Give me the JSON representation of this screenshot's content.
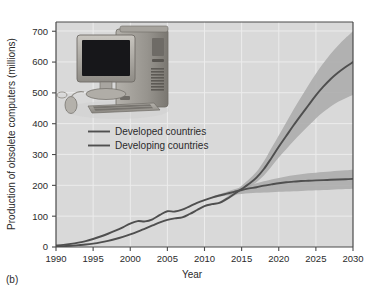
{
  "figure": {
    "panel_label": "(b)",
    "background": "#ffffff",
    "plot_background": "#d9d9d9",
    "grid_color": "#ececec",
    "axis_color": "#4a4a4a",
    "line_color": "#4f4f4f",
    "band_color": "#a9a9a9"
  },
  "inset_image": {
    "name": "desktop-computer-photo",
    "description": "Photograph of an obsolete desktop computer: CRT-style flat monitor, tower case, keyboard and mouse",
    "parts": [
      "monitor",
      "tower",
      "keyboard",
      "mouse"
    ]
  },
  "chart_data": {
    "type": "line",
    "title": "",
    "xlabel": "Year",
    "ylabel": "Production of obsolete computers (millions)",
    "xlim": [
      1990,
      2030
    ],
    "ylim": [
      0,
      730
    ],
    "xticks": [
      1990,
      1995,
      2000,
      2005,
      2010,
      2015,
      2020,
      2025,
      2030
    ],
    "yticks": [
      0,
      100,
      200,
      300,
      400,
      500,
      600,
      700
    ],
    "grid": true,
    "legend_position": "upper-left",
    "x": [
      1990,
      1991,
      1992,
      1993,
      1994,
      1995,
      1996,
      1997,
      1998,
      1999,
      2000,
      2001,
      2002,
      2003,
      2004,
      2005,
      2006,
      2007,
      2008,
      2009,
      2010,
      2011,
      2012,
      2013,
      2014,
      2015,
      2016,
      2017,
      2018,
      2019,
      2020,
      2021,
      2022,
      2023,
      2024,
      2025,
      2026,
      2027,
      2028,
      2029,
      2030
    ],
    "series": [
      {
        "name": "Developed countries",
        "values": [
          5,
          7,
          10,
          14,
          19,
          26,
          34,
          43,
          53,
          64,
          76,
          84,
          83,
          90,
          104,
          116,
          115,
          121,
          132,
          143,
          152,
          160,
          167,
          173,
          179,
          185,
          190,
          194,
          199,
          203,
          207,
          210,
          212,
          214,
          215,
          216,
          217,
          218,
          219,
          220,
          221
        ],
        "band_low": [
          5,
          7,
          10,
          14,
          19,
          26,
          34,
          43,
          53,
          64,
          76,
          84,
          83,
          90,
          104,
          116,
          115,
          121,
          132,
          143,
          152,
          158,
          163,
          167,
          170,
          172,
          174,
          176,
          177,
          178,
          179,
          180,
          181,
          182,
          183,
          184,
          185,
          186,
          187,
          188,
          189
        ],
        "band_high": [
          5,
          7,
          10,
          14,
          19,
          26,
          34,
          43,
          53,
          64,
          76,
          84,
          83,
          90,
          104,
          116,
          115,
          121,
          132,
          143,
          152,
          162,
          171,
          179,
          187,
          194,
          201,
          207,
          213,
          219,
          224,
          229,
          233,
          236,
          239,
          241,
          243,
          245,
          247,
          249,
          251
        ]
      },
      {
        "name": "Developing countries",
        "values": [
          2,
          3,
          4,
          6,
          8,
          11,
          15,
          20,
          26,
          33,
          41,
          50,
          60,
          70,
          80,
          88,
          93,
          96,
          107,
          120,
          133,
          139,
          143,
          156,
          172,
          188,
          205,
          225,
          253,
          288,
          325,
          360,
          395,
          428,
          460,
          492,
          520,
          545,
          566,
          584,
          600
        ],
        "band_low": [
          2,
          3,
          4,
          6,
          8,
          11,
          15,
          20,
          26,
          33,
          41,
          50,
          60,
          70,
          80,
          88,
          93,
          96,
          107,
          120,
          133,
          138,
          141,
          152,
          166,
          180,
          194,
          210,
          232,
          260,
          290,
          317,
          344,
          369,
          393,
          417,
          438,
          456,
          471,
          483,
          493
        ],
        "band_high": [
          2,
          3,
          4,
          6,
          8,
          11,
          15,
          20,
          26,
          33,
          41,
          50,
          60,
          70,
          80,
          88,
          93,
          96,
          107,
          120,
          133,
          141,
          147,
          162,
          180,
          199,
          220,
          244,
          278,
          320,
          362,
          404,
          446,
          486,
          525,
          562,
          596,
          627,
          654,
          678,
          700
        ]
      }
    ]
  },
  "legend": {
    "items": [
      {
        "label": "Developed countries"
      },
      {
        "label": "Developing countries"
      }
    ]
  }
}
